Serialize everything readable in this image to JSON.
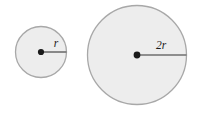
{
  "figure": {
    "background_color": "#ffffff",
    "width": 198,
    "height": 127
  },
  "style": {
    "circle_fill": "#ededed",
    "circle_stroke": "#a8a8a8",
    "radius_line_color": "#6e6e6e",
    "center_dot_color": "#1a1a1a",
    "label_color": "#1a1a1a"
  },
  "shapes": [
    {
      "name": "small-circle",
      "label": "r",
      "center_x": 41,
      "center_y": 52,
      "radius": 25.5,
      "label_x": 56,
      "label_y": 47
    },
    {
      "name": "large-circle",
      "label": "2r",
      "center_x": 137,
      "center_y": 55,
      "radius": 49.5,
      "label_x": 160,
      "label_y": 47
    }
  ]
}
